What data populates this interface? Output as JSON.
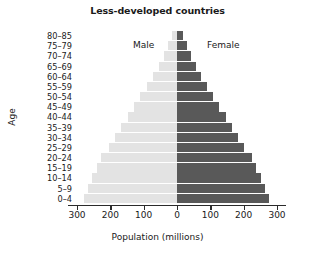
{
  "chart_data": {
    "type": "bar",
    "subtype": "population-pyramid",
    "title": "Less-developed countries",
    "xlabel": "Population (millions)",
    "ylabel": "Age",
    "categories": [
      "0–4",
      "5–9",
      "10–14",
      "15–19",
      "20–24",
      "25–29",
      "30–34",
      "35–39",
      "40–44",
      "45–49",
      "50–54",
      "55–59",
      "60–64",
      "65–69",
      "70–74",
      "75–79",
      "80–85"
    ],
    "categories_top_down": [
      "80–85",
      "75–79",
      "70–74",
      "65–69",
      "60–64",
      "55–59",
      "50–54",
      "45–49",
      "40–44",
      "35–39",
      "30–34",
      "25–29",
      "20–24",
      "15–19",
      "10–14",
      "5–9",
      "0–4"
    ],
    "series": [
      {
        "name": "Male",
        "color": "#e3e3e3",
        "side": "left",
        "values": [
          278,
          268,
          255,
          240,
          228,
          205,
          186,
          168,
          148,
          128,
          110,
          90,
          72,
          55,
          40,
          26,
          14
        ]
      },
      {
        "name": "Female",
        "color": "#595959",
        "side": "right",
        "values": [
          275,
          264,
          251,
          236,
          224,
          201,
          183,
          165,
          146,
          127,
          109,
          90,
          73,
          57,
          43,
          29,
          17
        ]
      }
    ],
    "xticks": [
      300,
      200,
      100,
      0,
      100,
      200,
      300
    ],
    "xtick_labels": [
      "300",
      "200",
      "100",
      "0",
      "100",
      "200",
      "300"
    ],
    "xlim": [
      -300,
      300
    ],
    "grid": false,
    "legend": "inline",
    "legend_entries": [
      "Male",
      "Female"
    ],
    "annotations": [
      {
        "text": "Male",
        "position": "upper-left-of-center"
      },
      {
        "text": "Female",
        "position": "upper-right-of-center"
      }
    ]
  },
  "colors": {
    "male_bar": "#e3e3e3",
    "female_bar": "#595959",
    "axis": "#2b2b2b",
    "text": "#1a1a1a",
    "background": "#ffffff"
  }
}
